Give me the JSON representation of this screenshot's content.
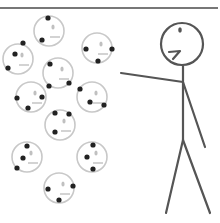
{
  "panel": {
    "description": "Comic panel: stick figure pointing at a crowd of ten dotted smiley faces",
    "colors": {
      "background": "#ffffff",
      "border": "#4a4a4a",
      "figure_stroke": "#555555",
      "face_outline": "#c8c8c8",
      "face_feature": "#c0c0c0",
      "dot": "#222222"
    }
  },
  "faces": [
    {
      "cx": 49,
      "cy": 31,
      "dots": [
        [
          48,
          18
        ],
        [
          42,
          40
        ]
      ]
    },
    {
      "cx": 18,
      "cy": 59,
      "dots": [
        [
          23,
          43
        ],
        [
          15,
          54
        ],
        [
          8,
          68
        ]
      ]
    },
    {
      "cx": 97,
      "cy": 48,
      "dots": [
        [
          86,
          49
        ],
        [
          98,
          61
        ],
        [
          112,
          49
        ]
      ]
    },
    {
      "cx": 58,
      "cy": 73,
      "dots": [
        [
          50,
          64
        ],
        [
          49,
          86
        ],
        [
          69,
          83
        ]
      ]
    },
    {
      "cx": 31,
      "cy": 97,
      "dots": [
        [
          17,
          98
        ],
        [
          28,
          108
        ],
        [
          42,
          97
        ]
      ]
    },
    {
      "cx": 92,
      "cy": 97,
      "dots": [
        [
          80,
          89
        ],
        [
          90,
          102
        ],
        [
          104,
          105
        ]
      ]
    },
    {
      "cx": 60,
      "cy": 125,
      "dots": [
        [
          55,
          113
        ],
        [
          69,
          114
        ],
        [
          55,
          132
        ]
      ]
    },
    {
      "cx": 27,
      "cy": 157,
      "dots": [
        [
          27,
          146
        ],
        [
          23,
          158
        ],
        [
          17,
          168
        ]
      ]
    },
    {
      "cx": 92,
      "cy": 157,
      "dots": [
        [
          93,
          145
        ],
        [
          87,
          157
        ],
        [
          93,
          169
        ]
      ]
    },
    {
      "cx": 59,
      "cy": 188,
      "dots": [
        [
          48,
          189
        ],
        [
          59,
          200
        ],
        [
          73,
          186
        ]
      ]
    }
  ],
  "figure": {
    "head": {
      "cx": 182,
      "cy": 44,
      "r": 21
    },
    "eye": {
      "cx": 180,
      "cy": 30
    },
    "mouth": "M169,52 L180,51 L173,59",
    "neck_to_hip": [
      [
        183,
        66
      ],
      [
        183,
        140
      ]
    ],
    "pointing_arm": [
      [
        121,
        73
      ],
      [
        183,
        82
      ]
    ],
    "other_arm": [
      [
        183,
        82
      ],
      [
        205,
        147
      ]
    ],
    "left_leg": [
      [
        183,
        140
      ],
      [
        166,
        213
      ]
    ],
    "right_leg": [
      [
        183,
        140
      ],
      [
        210,
        213
      ]
    ]
  }
}
